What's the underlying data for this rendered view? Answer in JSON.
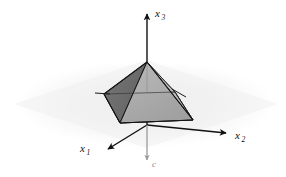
{
  "figure": {
    "background_color": "#ffffff",
    "plane_color": "#f2f2f2",
    "axis_color": "#111111",
    "cone_face_left_color": "#6d6d6d",
    "cone_face_front_color": "#a9a9a9",
    "cone_face_right_color": "#bdbdbd",
    "cone_base_color": "#b4b4b4",
    "cone_edge_color": "#1a1a1a",
    "vector_color": "#9a9a9a"
  },
  "axes": [
    {
      "id": "x1",
      "label": "x",
      "subscript": "1",
      "direction": "down-left",
      "arrow_tip": {
        "x": 110,
        "y": 148
      }
    },
    {
      "id": "x2",
      "label": "x",
      "subscript": "2",
      "direction": "right-down",
      "arrow_tip": {
        "x": 228,
        "y": 133
      }
    },
    {
      "id": "x3",
      "label": "x",
      "subscript": "3",
      "direction": "up",
      "arrow_tip": {
        "x": 147,
        "y": 10
      }
    }
  ],
  "vectors": [
    {
      "id": "c",
      "label": "c",
      "direction": "down",
      "origin": {
        "x": 147,
        "y": 125
      },
      "arrow_tip": {
        "x": 147,
        "y": 163
      }
    }
  ],
  "origin": {
    "x": 147,
    "y": 125
  },
  "cone": {
    "apex": {
      "x": 147,
      "y": 62
    },
    "base_vertices": [
      {
        "id": "v-left",
        "x": 104,
        "y": 94
      },
      {
        "id": "v-front",
        "x": 120,
        "y": 123
      },
      {
        "id": "v-right",
        "x": 193,
        "y": 120
      },
      {
        "id": "v-back",
        "x": 175,
        "y": 92
      }
    ],
    "ticks": [
      {
        "id": "tick-left",
        "x1": 95,
        "y1": 93,
        "x2": 110,
        "y2": 94
      },
      {
        "id": "tick-right",
        "x1": 173,
        "y1": 90,
        "x2": 185,
        "y2": 97
      }
    ]
  }
}
